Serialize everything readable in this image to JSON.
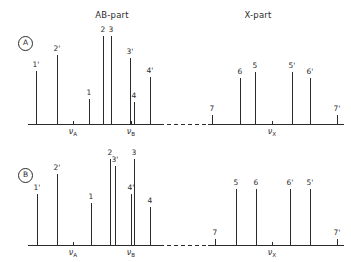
{
  "figure": {
    "width": 351,
    "height": 262,
    "background": "#ffffff",
    "stroke_color": "#2b2b2b"
  },
  "headers": [
    {
      "name": "ab-part-header",
      "text": "AB-part",
      "x": 112,
      "y": 10
    },
    {
      "name": "x-part-header",
      "text": "X-part",
      "x": 258,
      "y": 10
    }
  ],
  "panels": [
    {
      "id": "A",
      "badge": "A",
      "badge_x": 18,
      "badge_y": 36,
      "baseline_y": 124,
      "axis_x_start": 28,
      "axis_x_end": 344,
      "gap_start": 160,
      "gap_end": 208,
      "nu_ticks": [
        {
          "label": "ν",
          "sub": "A",
          "x": 73
        },
        {
          "label": "ν",
          "sub": "B",
          "x": 131
        },
        {
          "label": "ν",
          "sub": "X",
          "x": 272
        }
      ],
      "nu_label_y": 127,
      "peaks": [
        {
          "label": "1'",
          "x": 36,
          "height": 53
        },
        {
          "label": "2'",
          "x": 57,
          "height": 69
        },
        {
          "label": "1",
          "x": 89,
          "height": 25
        },
        {
          "label": "2",
          "x": 103,
          "height": 88
        },
        {
          "label": "3",
          "x": 111,
          "height": 88
        },
        {
          "label": "3'",
          "x": 130,
          "height": 66
        },
        {
          "label": "4",
          "x": 134,
          "height": 22
        },
        {
          "label": "4'",
          "x": 150,
          "height": 47
        },
        {
          "label": "7",
          "x": 212,
          "height": 9
        },
        {
          "label": "6",
          "x": 240,
          "height": 46
        },
        {
          "label": "5",
          "x": 255,
          "height": 52
        },
        {
          "label": "5'",
          "x": 292,
          "height": 52
        },
        {
          "label": "6'",
          "x": 310,
          "height": 46
        },
        {
          "label": "7'",
          "x": 337,
          "height": 9
        }
      ]
    },
    {
      "id": "B",
      "badge": "B",
      "badge_x": 18,
      "badge_y": 168,
      "baseline_y": 245,
      "axis_x_start": 28,
      "axis_x_end": 344,
      "gap_start": 160,
      "gap_end": 208,
      "nu_ticks": [
        {
          "label": "ν",
          "sub": "A",
          "x": 73
        },
        {
          "label": "ν",
          "sub": "B",
          "x": 131
        },
        {
          "label": "ν",
          "sub": "X",
          "x": 272
        }
      ],
      "nu_label_y": 248,
      "peaks": [
        {
          "label": "1'",
          "x": 37,
          "height": 51
        },
        {
          "label": "2'",
          "x": 57,
          "height": 71
        },
        {
          "label": "1",
          "x": 91,
          "height": 42
        },
        {
          "label": "2",
          "x": 110,
          "height": 86
        },
        {
          "label": "3'",
          "x": 115,
          "height": 79
        },
        {
          "label": "4'",
          "x": 131,
          "height": 51
        },
        {
          "label": "3",
          "x": 134,
          "height": 86
        },
        {
          "label": "4",
          "x": 150,
          "height": 38
        },
        {
          "label": "7",
          "x": 215,
          "height": 6
        },
        {
          "label": "5",
          "x": 236,
          "height": 56
        },
        {
          "label": "6",
          "x": 256,
          "height": 56
        },
        {
          "label": "6'",
          "x": 290,
          "height": 56
        },
        {
          "label": "5'",
          "x": 310,
          "height": 56
        },
        {
          "label": "7'",
          "x": 337,
          "height": 6
        }
      ]
    }
  ],
  "nu_top_labels": [
    {
      "label": "ν",
      "sub": "A",
      "x": 73,
      "y": 130
    },
    {
      "label": "ν",
      "sub": "B",
      "x": 131,
      "y": 130
    },
    {
      "label": "ν",
      "sub": "X",
      "x": 272,
      "y": 130
    }
  ]
}
